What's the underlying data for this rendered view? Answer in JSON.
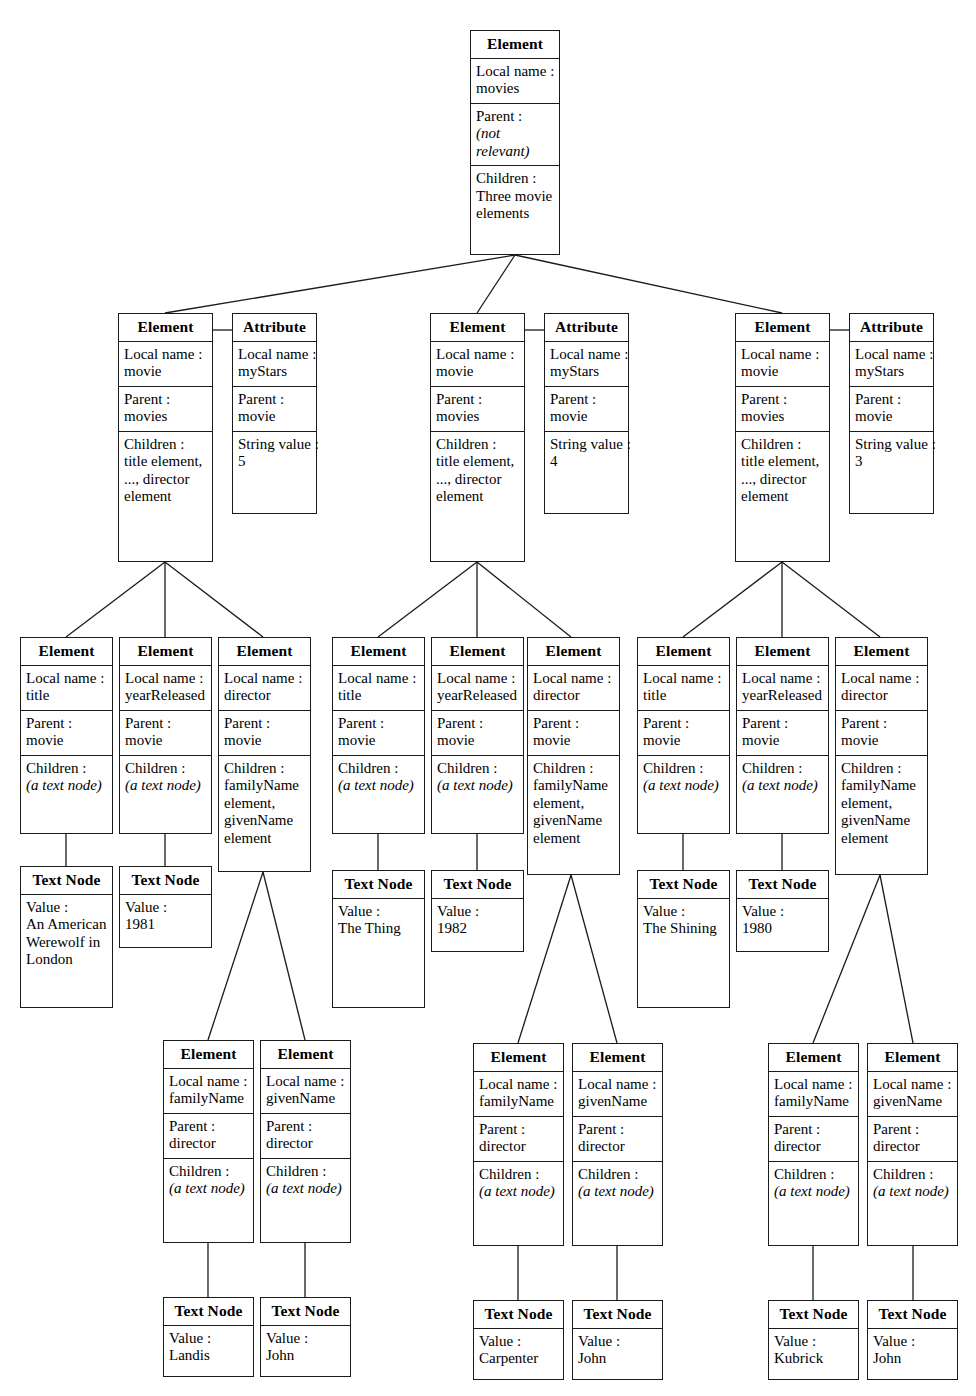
{
  "diagram": {
    "type": "dom-tree",
    "title_label": "Element",
    "attribute_label": "Attribute",
    "textnode_label": "Text Node",
    "field_labels": {
      "local_name": "Local name :",
      "parent": "Parent :",
      "children": "Children :",
      "string_value": "String value :",
      "value": "Value :"
    },
    "common_values": {
      "a_text_node": "(a text node)",
      "not_relevant": "(not relevant)",
      "movie": "movie",
      "movies": "movies",
      "director": "director",
      "title": "title",
      "year_released": "yearReleased",
      "family_name": "familyName",
      "given_name": "givenName",
      "my_stars": "myStars",
      "three_movie_elements": "Three movie elements",
      "title_to_director": "title element, ..., director element",
      "family_given_elements": "familyName element, givenName element"
    }
  },
  "root": {
    "kind": "Element",
    "local_name": "movies",
    "parent": "(not relevant)",
    "children": "Three movie elements"
  },
  "movies": [
    {
      "element": {
        "kind": "Element",
        "local_name": "movie",
        "parent": "movies",
        "children": "title element, ..., director element"
      },
      "attribute": {
        "kind": "Attribute",
        "local_name": "myStars",
        "parent": "movie",
        "string_value": "5"
      },
      "title": {
        "kind": "Element",
        "local_name": "title",
        "parent": "movie",
        "children": "(a text node)",
        "text_node": {
          "kind": "Text Node",
          "value": "An American Werewolf in London"
        }
      },
      "year": {
        "kind": "Element",
        "local_name": "yearReleased",
        "parent": "movie",
        "children": "(a text node)",
        "text_node": {
          "kind": "Text Node",
          "value": "1981"
        }
      },
      "director": {
        "kind": "Element",
        "local_name": "director",
        "parent": "movie",
        "children": "familyName element, givenName element",
        "family_name": {
          "kind": "Element",
          "local_name": "familyName",
          "parent": "director",
          "children": "(a text node)",
          "text_node": {
            "kind": "Text Node",
            "value": "Landis"
          }
        },
        "given_name": {
          "kind": "Element",
          "local_name": "givenName",
          "parent": "director",
          "children": "(a text node)",
          "text_node": {
            "kind": "Text Node",
            "value": "John"
          }
        }
      }
    },
    {
      "element": {
        "kind": "Element",
        "local_name": "movie",
        "parent": "movies",
        "children": "title element, ..., director element"
      },
      "attribute": {
        "kind": "Attribute",
        "local_name": "myStars",
        "parent": "movie",
        "string_value": "4"
      },
      "title": {
        "kind": "Element",
        "local_name": "title",
        "parent": "movie",
        "children": "(a text node)",
        "text_node": {
          "kind": "Text Node",
          "value": "The Thing"
        }
      },
      "year": {
        "kind": "Element",
        "local_name": "yearReleased",
        "parent": "movie",
        "children": "(a text node)",
        "text_node": {
          "kind": "Text Node",
          "value": "1982"
        }
      },
      "director": {
        "kind": "Element",
        "local_name": "director",
        "parent": "movie",
        "children": "familyName element, givenName element",
        "family_name": {
          "kind": "Element",
          "local_name": "familyName",
          "parent": "director",
          "children": "(a text node)",
          "text_node": {
            "kind": "Text Node",
            "value": "Carpenter"
          }
        },
        "given_name": {
          "kind": "Element",
          "local_name": "givenName",
          "parent": "director",
          "children": "(a text node)",
          "text_node": {
            "kind": "Text Node",
            "value": "John"
          }
        }
      }
    },
    {
      "element": {
        "kind": "Element",
        "local_name": "movie",
        "parent": "movies",
        "children": "title element, ..., director element"
      },
      "attribute": {
        "kind": "Attribute",
        "local_name": "myStars",
        "parent": "movie",
        "string_value": "3"
      },
      "title": {
        "kind": "Element",
        "local_name": "title",
        "parent": "movie",
        "children": "(a text node)",
        "text_node": {
          "kind": "Text Node",
          "value": "The Shining"
        }
      },
      "year": {
        "kind": "Element",
        "local_name": "yearReleased",
        "parent": "movie",
        "children": "(a text node)",
        "text_node": {
          "kind": "Text Node",
          "value": "1980"
        }
      },
      "director": {
        "kind": "Element",
        "local_name": "director",
        "parent": "movie",
        "children": "familyName element, givenName element",
        "family_name": {
          "kind": "Element",
          "local_name": "familyName",
          "parent": "director",
          "children": "(a text node)",
          "text_node": {
            "kind": "Text Node",
            "value": "Kubrick"
          }
        },
        "given_name": {
          "kind": "Element",
          "local_name": "givenName",
          "parent": "director",
          "children": "(a text node)",
          "text_node": {
            "kind": "Text Node",
            "value": "John"
          }
        }
      }
    }
  ]
}
